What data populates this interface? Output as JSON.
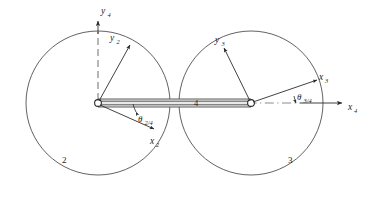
{
  "figure": {
    "type": "kinematic-linkage-diagram",
    "background_color": "#ffffff",
    "line_color": "#3a3a3a",
    "width": 369,
    "height": 197
  },
  "bodies": [
    {
      "id": "link-2",
      "label": "2",
      "shape": "circle",
      "center": {
        "x": 98,
        "y": 103
      },
      "radius": 72,
      "label_position": {
        "x": 62,
        "y": 160
      }
    },
    {
      "id": "link-3",
      "label": "3",
      "shape": "circle",
      "center": {
        "x": 251,
        "y": 103
      },
      "radius": 72,
      "label_position": {
        "x": 288,
        "y": 160
      }
    }
  ],
  "coupler": {
    "id": "link-4",
    "label": "4",
    "label_position": {
      "x": 196,
      "y": 106
    },
    "start": {
      "x": 98,
      "y": 103
    },
    "end": {
      "x": 251,
      "y": 103
    },
    "half_thickness": 4
  },
  "joints": [
    {
      "id": "joint-left",
      "x": 98,
      "y": 103,
      "radius": 3.4
    },
    {
      "id": "joint-right",
      "x": 251,
      "y": 103,
      "radius": 3.4
    }
  ],
  "axes": [
    {
      "id": "axis-y4",
      "label": "y",
      "subscript": "4",
      "origin": {
        "x": 98,
        "y": 103
      },
      "tip": {
        "x": 98,
        "y": 22
      },
      "style": "dashed",
      "label_position": {
        "x": 101,
        "y": 15
      }
    },
    {
      "id": "axis-x4",
      "label": "x",
      "subscript": "4",
      "origin": {
        "x": 251,
        "y": 103
      },
      "tip": {
        "x": 345,
        "y": 103
      },
      "style": "dash-dot",
      "label_position": {
        "x": 349,
        "y": 108
      }
    },
    {
      "id": "axis-y2",
      "label": "y",
      "subscript": "2",
      "origin": {
        "x": 98,
        "y": 103
      },
      "tip": {
        "x": 131,
        "y": 44
      },
      "style": "solid",
      "label_position": {
        "x": 110,
        "y": 40
      }
    },
    {
      "id": "axis-x2",
      "label": "x",
      "subscript": "2",
      "origin": {
        "x": 98,
        "y": 103
      },
      "tip": {
        "x": 155,
        "y": 130
      },
      "style": "solid",
      "label_position": {
        "x": 152,
        "y": 143
      }
    },
    {
      "id": "axis-y3",
      "label": "y",
      "subscript": "3",
      "origin": {
        "x": 251,
        "y": 103
      },
      "tip": {
        "x": 223,
        "y": 46
      },
      "style": "solid",
      "label_position": {
        "x": 219,
        "y": 42
      }
    },
    {
      "id": "axis-x3",
      "label": "x",
      "subscript": "3",
      "origin": {
        "x": 251,
        "y": 103
      },
      "tip": {
        "x": 318,
        "y": 79
      },
      "style": "solid",
      "label_position": {
        "x": 320,
        "y": 78
      }
    }
  ],
  "angles": [
    {
      "id": "angle-theta-2-4",
      "symbol": "θ",
      "subscript": "2/4",
      "label_position": {
        "x": 135,
        "y": 121
      },
      "vertex": {
        "x": 98,
        "y": 103
      },
      "arc_radius": 38,
      "from_deg": 0,
      "to_deg": -25
    },
    {
      "id": "angle-theta-3-4",
      "symbol": "θ",
      "subscript": "3/4",
      "label_position": {
        "x": 298,
        "y": 99
      },
      "vertex": {
        "x": 251,
        "y": 103
      },
      "arc_radius": 45,
      "from_deg": 0,
      "to_deg": 20
    }
  ]
}
